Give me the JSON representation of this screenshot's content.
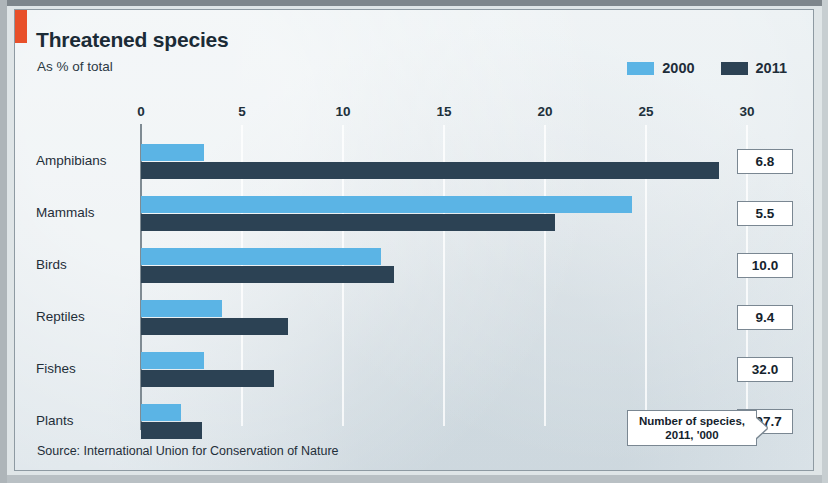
{
  "panel": {
    "accent_color": "#e8502a",
    "background_color": "#e3eaee"
  },
  "header": {
    "title": "Threatened species",
    "subtitle": "As % of total"
  },
  "legend": [
    {
      "label": "2000",
      "color": "#5bb4e5"
    },
    {
      "label": "2011",
      "color": "#2c4254"
    }
  ],
  "annotation": {
    "line1": "Number of species,",
    "line2": "2011, '000"
  },
  "source": "Source: International Union for Conservation of Nature",
  "chart_data": {
    "type": "bar",
    "orientation": "horizontal",
    "title": "Threatened species",
    "subtitle": "As % of total",
    "xlabel": "",
    "ylabel": "",
    "xlim": [
      0,
      30
    ],
    "xticks": [
      0,
      5,
      10,
      15,
      20,
      25,
      30
    ],
    "grid": true,
    "legend_position": "top-right",
    "categories": [
      "Amphibians",
      "Mammals",
      "Birds",
      "Reptiles",
      "Fishes",
      "Plants"
    ],
    "series": [
      {
        "name": "2000",
        "color": "#5bb4e5",
        "values": [
          3.1,
          24.3,
          11.9,
          4.0,
          3.1,
          2.0
        ]
      },
      {
        "name": "2011",
        "color": "#2c4254",
        "values": [
          28.6,
          20.5,
          12.5,
          7.3,
          6.6,
          3.0
        ]
      }
    ],
    "annotation_label": "Number of species, 2011, '000",
    "number_of_species_2011_thousands": [
      "6.8",
      "5.5",
      "10.0",
      "9.4",
      "32.0",
      "307.7"
    ],
    "source": "Source: International Union for Conservation of Nature"
  }
}
